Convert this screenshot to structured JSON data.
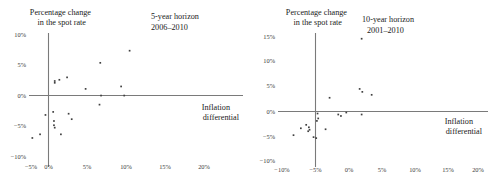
{
  "figure": {
    "panels": [
      {
        "id": "left",
        "title_line1": "5-year horizon",
        "title_line2": "2006–2010",
        "y_axis_title_line1": "Percentage change",
        "y_axis_title_line2": "in the spot rate",
        "x_axis_title_line1": "Inflation",
        "x_axis_title_line2": "differential",
        "xticks": [
          "−5%",
          "0%",
          "5%",
          "10%",
          "15%",
          "20%"
        ],
        "yticks": [
          "10%",
          "5%",
          "0%",
          "−5%",
          "−10%"
        ]
      },
      {
        "id": "right",
        "title_line1": "10-year horizon",
        "title_line2": "2001–2010",
        "y_axis_title_line1": "Percentage change",
        "y_axis_title_line2": "in the spot rate",
        "x_axis_title_line1": "Inflation",
        "x_axis_title_line2": "differential",
        "xticks": [
          "−10%",
          "−5%",
          "0%",
          "5%",
          "10%",
          "15%",
          "20%"
        ],
        "yticks": [
          "15%",
          "10%",
          "5%",
          "0%",
          "−5%",
          "−10%"
        ]
      }
    ]
  },
  "chart_data": [
    {
      "type": "scatter",
      "title": "5-year horizon 2006–2010",
      "xlabel": "Inflation differential",
      "ylabel": "Percentage change in the spot rate",
      "xlim": [
        -5,
        20
      ],
      "ylim": [
        -10,
        10
      ],
      "xticks": [
        -5,
        0,
        5,
        10,
        15,
        20
      ],
      "yticks": [
        -10,
        -5,
        0,
        5,
        10
      ],
      "grid": false,
      "legend": "none",
      "marker_color": "#404040",
      "points": [
        {
          "x": 10.5,
          "y": 7.4
        },
        {
          "x": 6.7,
          "y": 5.4
        },
        {
          "x": 2.4,
          "y": 3.0
        },
        {
          "x": 0.8,
          "y": 2.4
        },
        {
          "x": 0.8,
          "y": 2.1
        },
        {
          "x": 1.4,
          "y": 2.6
        },
        {
          "x": 9.4,
          "y": 1.5
        },
        {
          "x": 4.8,
          "y": 1.1
        },
        {
          "x": 6.8,
          "y": 0.0
        },
        {
          "x": 9.8,
          "y": 0.0
        },
        {
          "x": 6.6,
          "y": -1.5
        },
        {
          "x": 2.6,
          "y": -3.0
        },
        {
          "x": 0.6,
          "y": -2.7
        },
        {
          "x": -0.4,
          "y": -3.2
        },
        {
          "x": 3.0,
          "y": -3.9
        },
        {
          "x": 0.7,
          "y": -4.2
        },
        {
          "x": 0.7,
          "y": -4.9
        },
        {
          "x": 0.8,
          "y": -5.3
        },
        {
          "x": 1.6,
          "y": -6.4
        },
        {
          "x": -1.1,
          "y": -6.4
        },
        {
          "x": -2.1,
          "y": -7.0
        }
      ]
    },
    {
      "type": "scatter",
      "title": "10-year horizon 2001–2010",
      "xlabel": "Inflation differential",
      "ylabel": "Percentage change in the spot rate",
      "xlim": [
        -10,
        20
      ],
      "ylim": [
        -10,
        15
      ],
      "xticks": [
        -10,
        -5,
        0,
        5,
        10,
        15,
        20
      ],
      "yticks": [
        -10,
        -5,
        0,
        5,
        10,
        15
      ],
      "grid": false,
      "legend": "none",
      "marker_color": "#404040",
      "points": [
        {
          "x": 6.9,
          "y": 14.8
        },
        {
          "x": 6.6,
          "y": 4.6
        },
        {
          "x": 7.0,
          "y": 4.0
        },
        {
          "x": 8.4,
          "y": 3.4
        },
        {
          "x": 2.1,
          "y": 2.8
        },
        {
          "x": 0.3,
          "y": -0.4
        },
        {
          "x": 4.6,
          "y": -0.2
        },
        {
          "x": 3.4,
          "y": -0.6
        },
        {
          "x": 3.8,
          "y": -0.9
        },
        {
          "x": 6.9,
          "y": -0.6
        },
        {
          "x": 0.4,
          "y": -1.4
        },
        {
          "x": 0.2,
          "y": -1.9
        },
        {
          "x": -1.4,
          "y": -2.7
        },
        {
          "x": -1.0,
          "y": -3.2
        },
        {
          "x": -2.2,
          "y": -3.4
        },
        {
          "x": -0.9,
          "y": -3.7
        },
        {
          "x": 1.5,
          "y": -3.6
        },
        {
          "x": -1.1,
          "y": -4.0
        },
        {
          "x": -3.3,
          "y": -4.8
        },
        {
          "x": -0.3,
          "y": -5.2
        },
        {
          "x": 0.1,
          "y": -5.4
        }
      ]
    }
  ]
}
